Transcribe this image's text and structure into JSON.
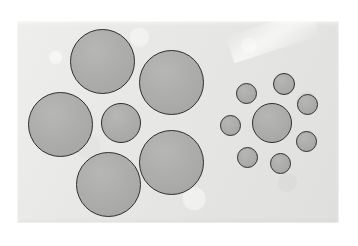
{
  "figure": {
    "name": "Ebbinghaus illusion (Titchener circles)",
    "background_color": "#ffffff",
    "paper_color": "#e7e7e5",
    "circle_fill": "#a9a9a8",
    "circle_stroke": "#2e2e2e"
  },
  "paper": {
    "x": 17,
    "y": 21,
    "width": 322,
    "height": 202,
    "crease": {
      "x": 228,
      "y": 22,
      "width": 90,
      "height": 28,
      "rotation": -18
    }
  },
  "clusters": [
    {
      "id": "left-cluster",
      "label": "Left cluster: small center circle with large surrounding circles",
      "center_circle": {
        "id": "left-center",
        "cx": 121,
        "cy": 123,
        "d": 40
      },
      "surround_circles": [
        {
          "id": "left-surround-top",
          "cx": 102,
          "cy": 61,
          "d": 65
        },
        {
          "id": "left-surround-left",
          "cx": 60,
          "cy": 124,
          "d": 65
        },
        {
          "id": "left-surround-upper-right",
          "cx": 171,
          "cy": 82,
          "d": 65
        },
        {
          "id": "left-surround-lower-right",
          "cx": 171,
          "cy": 162,
          "d": 65
        },
        {
          "id": "left-surround-bottom",
          "cx": 108,
          "cy": 184,
          "d": 65
        }
      ]
    },
    {
      "id": "right-cluster",
      "label": "Right cluster: same size center circle with small surrounding circles",
      "center_circle": {
        "id": "right-center",
        "cx": 272,
        "cy": 123,
        "d": 40
      },
      "surround_circles": [
        {
          "id": "right-surround-1",
          "cx": 246,
          "cy": 93,
          "d": 21
        },
        {
          "id": "right-surround-2",
          "cx": 284,
          "cy": 84,
          "d": 22
        },
        {
          "id": "right-surround-3",
          "cx": 307,
          "cy": 104,
          "d": 21
        },
        {
          "id": "right-surround-4",
          "cx": 306,
          "cy": 141,
          "d": 21
        },
        {
          "id": "right-surround-5",
          "cx": 280,
          "cy": 163,
          "d": 21
        },
        {
          "id": "right-surround-6",
          "cx": 247,
          "cy": 157,
          "d": 21
        },
        {
          "id": "right-surround-7",
          "cx": 230,
          "cy": 125,
          "d": 21
        }
      ]
    }
  ]
}
